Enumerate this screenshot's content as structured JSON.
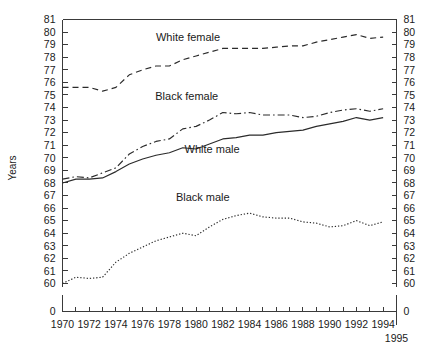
{
  "chart_data": {
    "type": "line",
    "title": "",
    "xlabel": "",
    "ylabel": "Years",
    "xlim": [
      1970,
      1995
    ],
    "ylim": [
      60,
      81
    ],
    "y_axis_break": true,
    "y_break_value": 0,
    "grid": false,
    "legend_position": "inline-annotations",
    "x_tick_labels": [
      "1970",
      "1972",
      "1974",
      "1976",
      "1978",
      "1980",
      "1982",
      "1984",
      "1986",
      "1988",
      "1990",
      "1992",
      "1994"
    ],
    "x_tick_values": [
      1970,
      1972,
      1974,
      1976,
      1978,
      1980,
      1982,
      1984,
      1986,
      1988,
      1990,
      1992,
      1994
    ],
    "x_end_label": "1995",
    "y_tick_labels": [
      "81",
      "80",
      "79",
      "78",
      "77",
      "76",
      "75",
      "74",
      "73",
      "72",
      "71",
      "70",
      "69",
      "68",
      "67",
      "66",
      "65",
      "64",
      "63",
      "62",
      "61",
      "60",
      "0"
    ],
    "y_tick_values": [
      81,
      80,
      79,
      78,
      77,
      76,
      75,
      74,
      73,
      72,
      71,
      70,
      69,
      68,
      67,
      66,
      65,
      64,
      63,
      62,
      61,
      60,
      0
    ],
    "x": [
      1970,
      1971,
      1972,
      1973,
      1974,
      1975,
      1976,
      1977,
      1978,
      1979,
      1980,
      1981,
      1982,
      1983,
      1984,
      1985,
      1986,
      1987,
      1988,
      1989,
      1990,
      1991,
      1992,
      1993,
      1994
    ],
    "series": [
      {
        "name": "White female",
        "label": "White female",
        "line_style": "dashed",
        "color": "#2b2b2b",
        "values": [
          75.6,
          75.6,
          75.6,
          75.3,
          75.6,
          76.6,
          77.0,
          77.3,
          77.3,
          77.8,
          78.1,
          78.4,
          78.7,
          78.7,
          78.7,
          78.7,
          78.8,
          78.9,
          78.9,
          79.2,
          79.4,
          79.6,
          79.8,
          79.5,
          79.6
        ]
      },
      {
        "name": "Black female",
        "label": "Black female",
        "line_style": "dash-dot",
        "color": "#2b2b2b",
        "values": [
          68.3,
          68.5,
          68.4,
          68.8,
          69.2,
          70.3,
          70.9,
          71.3,
          71.5,
          72.3,
          72.5,
          73.0,
          73.6,
          73.5,
          73.6,
          73.4,
          73.4,
          73.4,
          73.2,
          73.3,
          73.6,
          73.8,
          73.9,
          73.7,
          73.9
        ]
      },
      {
        "name": "White male",
        "label": "White male",
        "line_style": "solid",
        "color": "#2b2b2b",
        "values": [
          68.0,
          68.3,
          68.3,
          68.4,
          68.9,
          69.5,
          69.9,
          70.2,
          70.4,
          70.8,
          70.7,
          71.1,
          71.5,
          71.6,
          71.8,
          71.8,
          72.0,
          72.1,
          72.2,
          72.5,
          72.7,
          72.9,
          73.2,
          73.0,
          73.2
        ]
      },
      {
        "name": "Black male",
        "label": "Black male",
        "line_style": "dotted",
        "color": "#2b2b2b",
        "values": [
          60.0,
          60.5,
          60.4,
          60.5,
          61.7,
          62.4,
          62.9,
          63.4,
          63.7,
          64.0,
          63.8,
          64.5,
          65.1,
          65.4,
          65.6,
          65.3,
          65.2,
          65.2,
          64.9,
          64.8,
          64.5,
          64.6,
          65.0,
          64.6,
          64.9
        ]
      }
    ],
    "annotations": [
      {
        "text": "White female",
        "x": 1979.4,
        "y": 79.3
      },
      {
        "text": "Black female",
        "x": 1979.3,
        "y": 74.6
      },
      {
        "text": "White male",
        "x": 1981.2,
        "y": 70.4
      },
      {
        "text": "Black male",
        "x": 1980.5,
        "y": 66.6
      }
    ]
  },
  "axes": {
    "y_title": "Years",
    "y_title_right": ""
  }
}
